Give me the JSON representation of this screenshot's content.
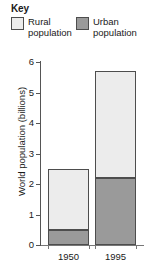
{
  "legend": {
    "title": "Key",
    "entries": [
      {
        "label": "Rural\npopulation",
        "label_line1": "Rural",
        "label_line2": "population",
        "color": "#ececec",
        "key": "rural"
      },
      {
        "label": "Urban\npopulation",
        "label_line1": "Urban",
        "label_line2": "population",
        "color": "#9a9a9a",
        "key": "urban"
      }
    ]
  },
  "axes": {
    "ylabel": "World population (billions)",
    "yticks": [
      "0",
      "1",
      "2",
      "3",
      "4",
      "5",
      "6"
    ],
    "xticks": [
      "1950",
      "1995"
    ]
  },
  "chart_data": {
    "type": "bar",
    "stacked": true,
    "title": "",
    "subtitle": "",
    "xlabel": "",
    "ylabel": "World population (billions)",
    "categories": [
      "1950",
      "1995"
    ],
    "series": [
      {
        "name": "Urban population",
        "values": [
          0.5,
          2.2
        ],
        "color": "#9a9a9a"
      },
      {
        "name": "Rural population",
        "values": [
          2.0,
          3.5
        ],
        "color": "#ececec"
      }
    ],
    "totals": [
      2.5,
      5.7
    ],
    "ylim": [
      0,
      6
    ],
    "ytick_step": 1,
    "grid": false,
    "legend": "top",
    "legend_title": "Key"
  }
}
